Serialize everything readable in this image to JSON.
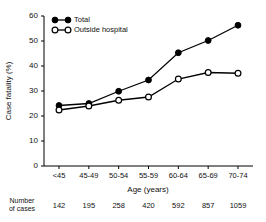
{
  "chart_data": {
    "type": "line",
    "title": "",
    "xlabel": "Age (years)",
    "ylabel": "Case fatality (%)",
    "categories": [
      "<45",
      "45-49",
      "50-54",
      "55-59",
      "60-64",
      "65-69",
      "70-74"
    ],
    "ylim": [
      0,
      60
    ],
    "yticks": [
      0,
      10,
      20,
      30,
      40,
      50,
      60
    ],
    "grid": false,
    "legend_position": "top-left",
    "series": [
      {
        "name": "Total",
        "marker": "filled-circle",
        "color": "#000000",
        "values": [
          24.2,
          25.0,
          29.9,
          34.4,
          45.3,
          50.2,
          56.3
        ]
      },
      {
        "name": "Outside hospital",
        "marker": "open-circle",
        "color": "#000000",
        "values": [
          22.4,
          24.0,
          26.3,
          27.6,
          34.8,
          37.4,
          37.1
        ]
      }
    ],
    "annotations": {
      "cases_row_label": "Number\nof cases",
      "cases_row_label_line1": "Number",
      "cases_row_label_line2": "of cases",
      "cases": [
        "142",
        "195",
        "258",
        "420",
        "592",
        "857",
        "1059"
      ]
    }
  },
  "legend": {
    "items": [
      {
        "label": "Total",
        "marker": "filled-circle"
      },
      {
        "label": "Outside hospital",
        "marker": "open-circle"
      }
    ]
  },
  "axes": {
    "y_title": "Case fatality (%)",
    "x_title": "Age (years)",
    "y_tick_labels": [
      "0",
      "10",
      "20",
      "30",
      "40",
      "50",
      "60"
    ],
    "x_tick_labels": [
      "<45",
      "45-49",
      "50-54",
      "55-59",
      "60-64",
      "65-69",
      "70-74"
    ]
  },
  "footer": {
    "label_line1": "Number",
    "label_line2": "of cases",
    "values": [
      "142",
      "195",
      "258",
      "420",
      "592",
      "857",
      "1059"
    ]
  }
}
